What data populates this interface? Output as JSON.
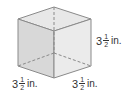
{
  "figure": {
    "shape": "cube",
    "colors": {
      "edge": "#8a8a8a",
      "top_face": "#e6e6e6",
      "left_face": "#d6d6d6",
      "right_face": "#ececec"
    },
    "labels": [
      {
        "id": "height",
        "whole": "3",
        "num": "1",
        "den": "2",
        "unit": "in."
      },
      {
        "id": "depth",
        "whole": "3",
        "num": "1",
        "den": "2",
        "unit": "in."
      },
      {
        "id": "width",
        "whole": "3",
        "num": "1",
        "den": "2",
        "unit": "in."
      }
    ]
  }
}
